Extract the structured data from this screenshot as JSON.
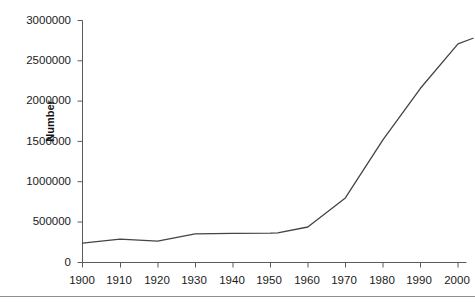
{
  "chart_data": {
    "type": "line",
    "title": "",
    "subtitle": "",
    "xlabel": "",
    "ylabel": "Number",
    "x": [
      1900,
      1910,
      1920,
      1930,
      1940,
      1950,
      1952,
      1960,
      1970,
      1980,
      1990,
      2000,
      2004
    ],
    "values": [
      240000,
      290000,
      265000,
      355000,
      360000,
      365000,
      368000,
      440000,
      800000,
      1520000,
      2160000,
      2710000,
      2780000
    ],
    "series": [
      {
        "name": "Number",
        "values": [
          240000,
          290000,
          265000,
          355000,
          360000,
          365000,
          368000,
          440000,
          800000,
          1520000,
          2160000,
          2710000,
          2780000
        ]
      }
    ],
    "xlim": [
      1900,
      2004
    ],
    "ylim": [
      0,
      3000000
    ],
    "xticks": [
      1900,
      1910,
      1920,
      1930,
      1940,
      1950,
      1960,
      1970,
      1980,
      1990,
      2000
    ],
    "yticks": [
      0,
      500000,
      1000000,
      1500000,
      2000000,
      2500000,
      3000000
    ],
    "grid": false,
    "legend": null,
    "line_color": "#444444"
  },
  "axes": {
    "y_title": "Number",
    "y_tick_labels": [
      "3000000",
      "2500000",
      "2000000",
      "1500000",
      "1000000",
      "500000",
      "0"
    ],
    "x_tick_labels": [
      "1900",
      "1910",
      "1920",
      "1930",
      "1940",
      "1950",
      "1960",
      "1970",
      "1980",
      "1990",
      "2000"
    ]
  }
}
